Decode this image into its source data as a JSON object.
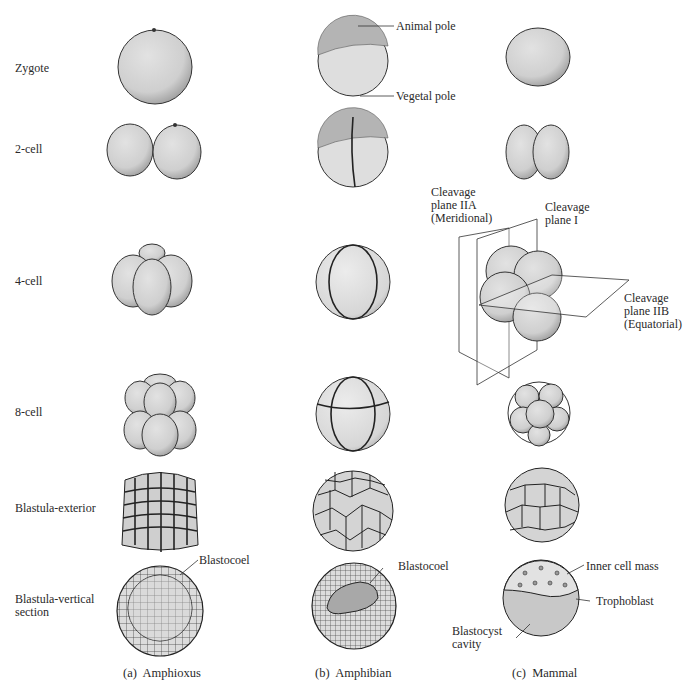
{
  "figure": {
    "row_labels": [
      {
        "id": "zygote",
        "text": "Zygote"
      },
      {
        "id": "2-cell",
        "text": "2-cell"
      },
      {
        "id": "4-cell",
        "text": "4-cell"
      },
      {
        "id": "8-cell",
        "text": "8-cell"
      },
      {
        "id": "blastula-exterior",
        "text": "Blastula-exterior"
      },
      {
        "id": "blastula-vertical-1",
        "text": "Blastula-vertical"
      },
      {
        "id": "blastula-vertical-2",
        "text": "section"
      }
    ],
    "column_captions": [
      {
        "letter": "(a)",
        "name": "Amphioxus"
      },
      {
        "letter": "(b)",
        "name": "Amphibian"
      },
      {
        "letter": "(c)",
        "name": "Mammal"
      }
    ],
    "annotations": {
      "animal_pole": "Animal pole",
      "vegetal_pole": "Vegetal pole",
      "plane_IIA_1": "Cleavage",
      "plane_IIA_2": "plane IIA",
      "plane_IIA_3": "(Meridional)",
      "plane_I_1": "Cleavage",
      "plane_I_2": "plane I",
      "plane_IIB_1": "Cleavage",
      "plane_IIB_2": "plane IIB",
      "plane_IIB_3": "(Equatorial)",
      "blastocoel_a": "Blastocoel",
      "blastocoel_b": "Blastocoel",
      "inner_cell_mass": "Inner cell mass",
      "trophoblast": "Trophoblast",
      "blastocyst_cavity_1": "Blastocyst",
      "blastocyst_cavity_2": "cavity"
    },
    "colors": {
      "cell_fill": "#d4d4d4",
      "cell_dark": "#a8a8a8",
      "outline": "#3a3a3a",
      "animal_hemisphere": "#b4b4b4",
      "vegetal_hemisphere": "#dedede"
    }
  }
}
